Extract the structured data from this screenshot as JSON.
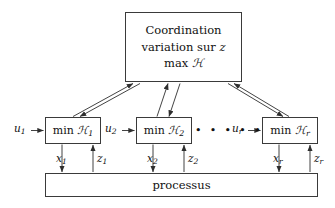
{
  "diagram": {
    "coordination": {
      "name": "coordination-box",
      "line1": "Coordination",
      "line2_prefix": "variation sur ",
      "line2_var": "z",
      "line3_prefix": "max ",
      "line3_var": "ℋ"
    },
    "subsystems": [
      {
        "id": "subsystem-1",
        "box_prefix": "min ",
        "box_var": "ℋ",
        "box_sub": "1",
        "input_label_var": "u",
        "input_label_sub": "1",
        "state_label_var": "x",
        "state_label_sub": "1",
        "coupling_label_var": "z",
        "coupling_label_sub": "1"
      },
      {
        "id": "subsystem-2",
        "box_prefix": "min ",
        "box_var": "ℋ",
        "box_sub": "2",
        "input_label_var": "u",
        "input_label_sub": "2",
        "state_label_var": "x",
        "state_label_sub": "2",
        "coupling_label_var": "z",
        "coupling_label_sub": "2"
      },
      {
        "id": "subsystem-r",
        "box_prefix": "min ",
        "box_var": "ℋ",
        "box_sub": "r",
        "input_label_var": "u",
        "input_label_sub": "r",
        "state_label_var": "x",
        "state_label_sub": "r",
        "coupling_label_var": "z",
        "coupling_label_sub": "r"
      }
    ],
    "ellipsis": "• • • • •",
    "process": {
      "name": "process-box",
      "label": "processus"
    },
    "colors": {
      "stroke": "#3a3a3a",
      "text": "#111111",
      "background": "#ffffff"
    }
  }
}
